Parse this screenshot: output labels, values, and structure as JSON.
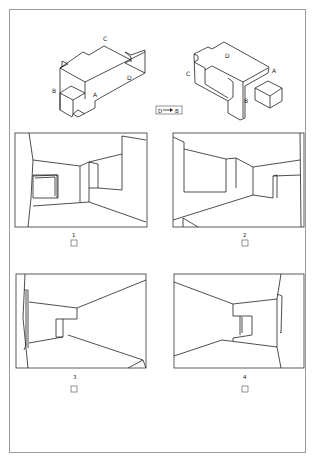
{
  "figure": {
    "object_left": {
      "labels": {
        "A": "A",
        "B": "B",
        "C": "C",
        "D": "D"
      }
    },
    "object_right": {
      "labels": {
        "A": "A",
        "B": "B",
        "C": "C",
        "D": "D"
      }
    },
    "transform_label": {
      "from": "D",
      "arrow": "→",
      "to": "B",
      "text": "D → B"
    },
    "options": [
      {
        "number": "1",
        "checked": false
      },
      {
        "number": "2",
        "checked": false
      },
      {
        "number": "3",
        "checked": false
      },
      {
        "number": "4",
        "checked": false
      }
    ]
  }
}
